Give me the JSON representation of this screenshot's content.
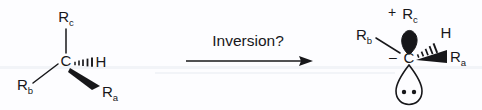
{
  "figure": {
    "background_color": "#fdfdff",
    "ink_color": "#17171a"
  },
  "reactant": {
    "name": "tetrahedral-stereocenter",
    "center_atom": "C",
    "substituents": [
      {
        "key": "rc",
        "base": "R",
        "sub": "c",
        "bond_style": "plain",
        "direction": "up"
      },
      {
        "key": "rb",
        "base": "R",
        "sub": "b",
        "bond_style": "plain",
        "direction": "down-left"
      },
      {
        "key": "h",
        "base": "H",
        "sub": "",
        "bond_style": "hashed-wedge",
        "direction": "right"
      },
      {
        "key": "ra",
        "base": "R",
        "sub": "a",
        "bond_style": "solid-wedge",
        "direction": "down-right"
      }
    ]
  },
  "reaction_arrow": {
    "label": "Inversion?",
    "direction": "right"
  },
  "product": {
    "name": "carbanion-with-lone-pair",
    "center_atom": "C",
    "formal_charge": "–",
    "detached_group_charge": "+",
    "detached_group": {
      "base": "R",
      "sub": "c"
    },
    "substituents": [
      {
        "key": "rb",
        "base": "R",
        "sub": "b",
        "bond_style": "plain",
        "direction": "up-left"
      },
      {
        "key": "h",
        "base": "H",
        "sub": "",
        "bond_style": "hashed-wedge",
        "direction": "up-right"
      },
      {
        "key": "ra",
        "base": "R",
        "sub": "a",
        "bond_style": "solid-wedge",
        "direction": "right"
      }
    ],
    "orbitals": [
      {
        "key": "upper-lobe",
        "fill": "solid",
        "position": "above-carbon"
      },
      {
        "key": "lower-lobe",
        "fill": "open",
        "position": "below-carbon",
        "lone_pair_dots": 2
      }
    ]
  }
}
